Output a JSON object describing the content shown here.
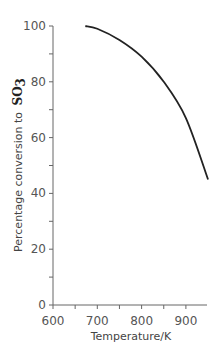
{
  "chart_data": {
    "type": "line",
    "title": "",
    "xlabel": "Temperature/K",
    "ylabel": "Percentage conversion to",
    "ylabel_formula": "SO",
    "ylabel_subscript": "3",
    "xlim": [
      600,
      950
    ],
    "ylim": [
      0,
      100
    ],
    "x_ticks": [
      600,
      700,
      800,
      900
    ],
    "x_minor_ticks": [
      650,
      750,
      850
    ],
    "y_ticks": [
      0,
      20,
      40,
      60,
      80,
      100
    ],
    "y_minor_ticks": [
      10,
      30,
      50,
      70,
      90
    ],
    "grid": false,
    "series": [
      {
        "name": "Conversion",
        "x": [
          673,
          700,
          750,
          800,
          850,
          900,
          950
        ],
        "y": [
          100,
          99,
          95,
          89,
          80,
          67,
          45
        ]
      }
    ],
    "colors": {
      "line": "#222222",
      "axis": "#666666"
    }
  }
}
